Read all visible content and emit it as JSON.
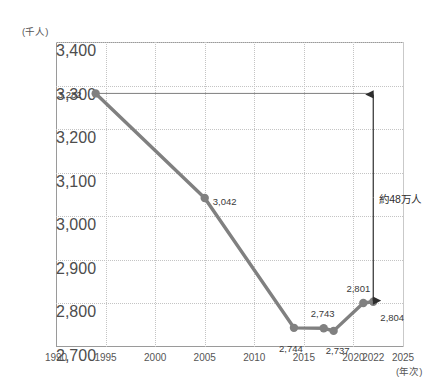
{
  "chart_data": {
    "type": "line",
    "title": "",
    "xlabel": "(年次)",
    "ylabel": "(千人)",
    "xlim": [
      1990,
      2025
    ],
    "ylim": [
      2700,
      3400
    ],
    "grid": true,
    "legend": "none",
    "x": [
      1994,
      2005,
      2014,
      2017,
      2018,
      2021,
      2022
    ],
    "values": [
      3282,
      3042,
      2744,
      2743,
      2737,
      2801,
      2804
    ],
    "point_labels": [
      "3,282",
      "3,042",
      "2,744",
      "2,743",
      "2,737",
      "2,801",
      "2,804"
    ],
    "ytick_labels": [
      "3,400",
      "3,300",
      "3,200",
      "3,100",
      "3,000",
      "2,900",
      "2,800",
      "2,700"
    ],
    "ytick_values": [
      3400,
      3300,
      3200,
      3100,
      3000,
      2900,
      2800,
      2700
    ],
    "xtick_labels": [
      "1990",
      "1995",
      "2000",
      "2005",
      "2010",
      "2015",
      "2020",
      "2022",
      "2025"
    ],
    "xtick_values": [
      1990,
      1995,
      2000,
      2005,
      2010,
      2015,
      2020,
      2022,
      2025
    ],
    "annotations": [
      {
        "text": "約48万人",
        "from_value": 3282,
        "to_value": 2804,
        "at_x": 2022,
        "style": "double-headed-arrow"
      }
    ],
    "series_color": "#808080",
    "annotation_color": "#2e2e2e",
    "grid_color": "#c4c4c4",
    "axis_color": "#9a9a9a"
  }
}
